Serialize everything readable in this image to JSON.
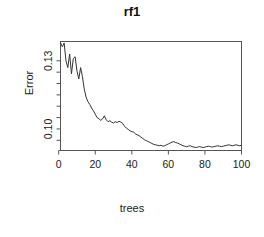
{
  "chart_data": {
    "type": "line",
    "title": "rf1",
    "xlabel": "trees",
    "ylabel": "Error",
    "xlim": [
      1,
      100
    ],
    "ylim": [
      0.0905,
      0.1385
    ],
    "grid": false,
    "legend": null,
    "x_ticks": [
      0,
      20,
      40,
      60,
      80,
      100
    ],
    "x_tick_labels": [
      "0",
      "20",
      "40",
      "60",
      "80",
      "100"
    ],
    "y_ticks": [
      0.1,
      0.13
    ],
    "y_tick_labels": [
      "0.10",
      "0.13"
    ],
    "y_minor_ticks": [
      0.095,
      0.105,
      0.11,
      0.115,
      0.12,
      0.125
    ],
    "line_color": "#333333",
    "box_color": "#555555",
    "series": [
      {
        "name": "OOB error",
        "x": [
          1,
          2,
          3,
          4,
          5,
          6,
          7,
          8,
          9,
          10,
          11,
          12,
          13,
          14,
          15,
          16,
          17,
          18,
          19,
          20,
          21,
          22,
          23,
          24,
          25,
          26,
          27,
          28,
          29,
          30,
          31,
          32,
          33,
          34,
          35,
          36,
          37,
          38,
          39,
          40,
          41,
          42,
          43,
          44,
          45,
          46,
          47,
          48,
          49,
          50,
          51,
          52,
          53,
          54,
          55,
          56,
          57,
          58,
          59,
          60,
          61,
          62,
          63,
          64,
          65,
          66,
          67,
          68,
          69,
          70,
          71,
          72,
          73,
          74,
          75,
          76,
          77,
          78,
          79,
          80,
          81,
          82,
          83,
          84,
          85,
          86,
          87,
          88,
          89,
          90,
          91,
          92,
          93,
          94,
          95,
          96,
          97,
          98,
          99,
          100
        ],
        "values": [
          0.138,
          0.1362,
          0.1378,
          0.13,
          0.127,
          0.133,
          0.1243,
          0.131,
          0.1318,
          0.1256,
          0.122,
          0.127,
          0.123,
          0.1175,
          0.114,
          0.112,
          0.1108,
          0.1092,
          0.108,
          0.1065,
          0.105,
          0.1045,
          0.1038,
          0.1044,
          0.1058,
          0.104,
          0.1032,
          0.1036,
          0.103,
          0.1026,
          0.1032,
          0.1028,
          0.1034,
          0.103,
          0.1024,
          0.1012,
          0.1004,
          0.0998,
          0.0992,
          0.0988,
          0.0986,
          0.0978,
          0.0974,
          0.097,
          0.0964,
          0.0958,
          0.0952,
          0.0948,
          0.0944,
          0.094,
          0.0936,
          0.0932,
          0.093,
          0.0928,
          0.0926,
          0.0928,
          0.0924,
          0.0926,
          0.093,
          0.0934,
          0.0938,
          0.0942,
          0.0944,
          0.094,
          0.0938,
          0.0934,
          0.093,
          0.0926,
          0.0924,
          0.0922,
          0.0924,
          0.0926,
          0.0922,
          0.092,
          0.0918,
          0.092,
          0.0922,
          0.092,
          0.0918,
          0.092,
          0.0922,
          0.0924,
          0.0922,
          0.092,
          0.0922,
          0.0924,
          0.0926,
          0.0924,
          0.0922,
          0.0924,
          0.0926,
          0.0928,
          0.093,
          0.0928,
          0.0926,
          0.0928,
          0.093,
          0.0928,
          0.0926,
          0.0928
        ]
      }
    ]
  }
}
